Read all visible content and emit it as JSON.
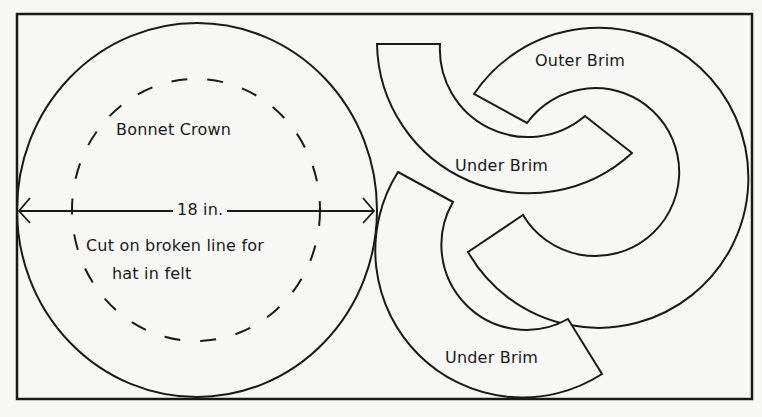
{
  "diagram": {
    "colors": {
      "background": "#f7f7f5",
      "stroke": "#1a1a1a"
    },
    "pieces": [
      {
        "id": "bonnet-crown",
        "label": "Bonnet Crown",
        "shape": "circle",
        "dimension_label": "18 in.",
        "note_line1": "Cut on broken line for",
        "note_line2": "hat in felt"
      },
      {
        "id": "outer-brim",
        "label": "Outer Brim",
        "shape": "partial-annulus"
      },
      {
        "id": "under-brim-upper",
        "label": "Under Brim",
        "shape": "partial-annulus"
      },
      {
        "id": "under-brim-lower",
        "label": "Under Brim",
        "shape": "partial-annulus"
      }
    ]
  }
}
